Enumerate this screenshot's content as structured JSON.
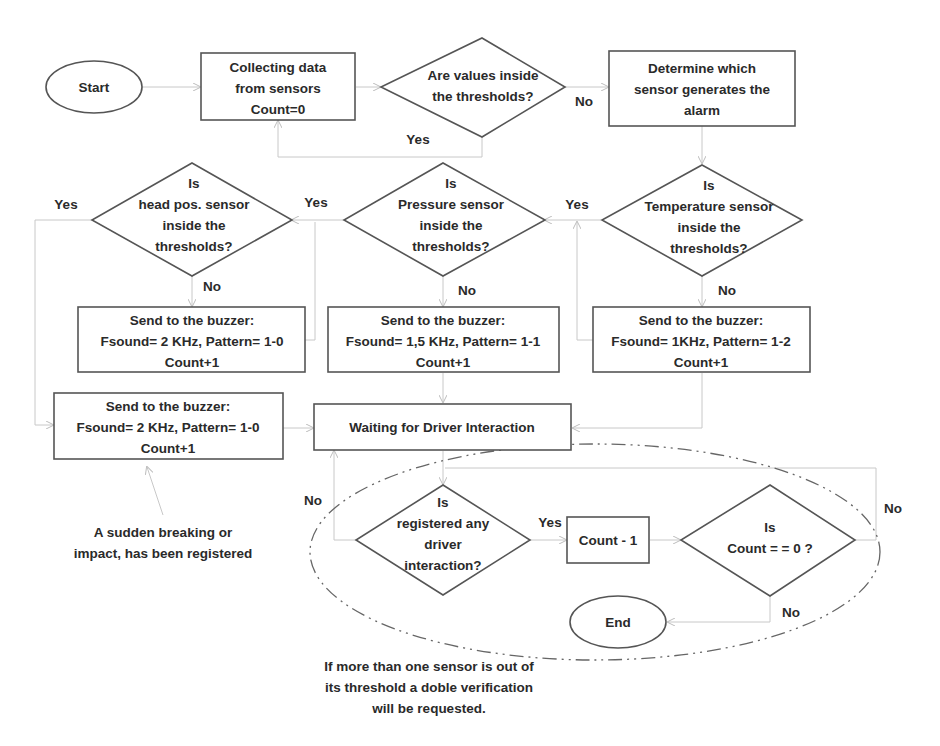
{
  "nodes": {
    "start": {
      "label": "Start"
    },
    "collect": {
      "lines": [
        "Collecting data",
        "from sensors",
        "Count=0"
      ]
    },
    "check_values": {
      "lines": [
        "Are values inside",
        "the thresholds?"
      ]
    },
    "determine": {
      "lines": [
        "Determine which",
        "sensor generates the",
        "alarm"
      ]
    },
    "head_decision": {
      "lines": [
        "Is",
        "head pos. sensor",
        "inside the",
        "thresholds?"
      ]
    },
    "pressure_decision": {
      "lines": [
        "Is",
        "Pressure sensor",
        "inside the",
        "thresholds?"
      ]
    },
    "temp_decision": {
      "lines": [
        "Is",
        "Temperature sensor",
        "inside the",
        "thresholds?"
      ]
    },
    "buzzer_head": {
      "lines": [
        "Send to the buzzer:",
        "Fsound= 2 KHz, Pattern= 1-0",
        "Count+1"
      ]
    },
    "buzzer_pressure": {
      "lines": [
        "Send to the buzzer:",
        "Fsound= 1,5 KHz, Pattern= 1-1",
        "Count+1"
      ]
    },
    "buzzer_temp": {
      "lines": [
        "Send to the buzzer:",
        "Fsound= 1KHz, Pattern= 1-2",
        "Count+1"
      ]
    },
    "buzzer_impact": {
      "lines": [
        "Send to the buzzer:",
        "Fsound= 2 KHz, Pattern= 1-0",
        "Count+1"
      ]
    },
    "waiting": {
      "label": "Waiting for Driver Interaction"
    },
    "interaction_decision": {
      "lines": [
        "Is",
        "registered any",
        "driver",
        "interaction?"
      ]
    },
    "count_minus": {
      "label": "Count - 1"
    },
    "count_zero_decision": {
      "lines": [
        "Is",
        "Count = = 0 ?"
      ]
    },
    "end": {
      "label": "End"
    }
  },
  "edge_labels": {
    "values_no": "No",
    "values_yes": "Yes",
    "head_yes": "Yes",
    "head_no": "No",
    "pressure_yes": "Yes",
    "pressure_no": "No",
    "temp_yes": "Yes",
    "temp_no": "No",
    "interaction_no": "No",
    "interaction_yes": "Yes",
    "count_zero_no_right": "No",
    "count_zero_no_bottom": "No"
  },
  "annotations": {
    "impact_note": [
      "A sudden breaking or",
      "impact, has been registered"
    ],
    "double_verification_note": [
      "If more than one sensor is out of",
      "its threshold a doble verification",
      "will be requested."
    ]
  },
  "colors": {
    "shape_stroke": "#555555",
    "connector": "#c8c8c8",
    "text": "#2a2a2a",
    "group_outline": "#666666"
  }
}
